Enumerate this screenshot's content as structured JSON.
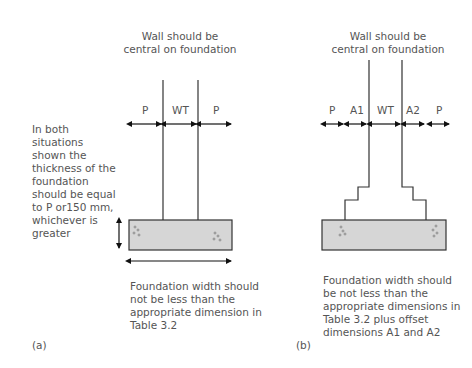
{
  "diagram_a": {
    "label": "(a)",
    "title_line1": "Wall should be",
    "title_line2": "central on foundation",
    "dim_labels": [
      "P",
      "WT",
      "P"
    ],
    "side_note": [
      "In both",
      "situations",
      "shown the",
      "thickness of the",
      "foundation",
      "should be equal",
      "to P or150 mm,",
      "whichever is",
      "greater"
    ],
    "caption": [
      "Foundation width should",
      "not be less than the",
      "appropriate dimension in",
      "Table 3.2"
    ]
  },
  "diagram_b": {
    "label": "(b)",
    "title_line1": "Wall should be",
    "title_line2": "central on foundation",
    "dim_labels": [
      "P",
      "A1",
      "WT",
      "A2",
      "P"
    ],
    "caption": [
      "Foundation width should",
      "be not less than the",
      "appropriate dimensions in",
      "Table 3.2 plus offset",
      "dimensions A1 and A2"
    ]
  },
  "colors": {
    "foundation_fill": "#d6d6d6",
    "line": "#333333",
    "text": "#555555"
  }
}
